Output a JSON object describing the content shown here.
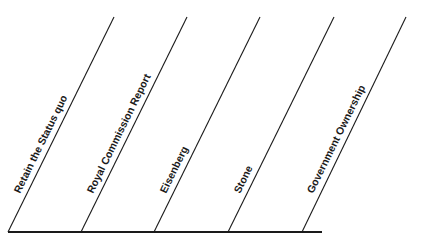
{
  "diagram": {
    "type": "continuum",
    "line_color": "#1a1a1a",
    "baseline": {
      "x1": 8,
      "y": 232,
      "x2": 322,
      "thickness": 2.2
    },
    "spokes": [
      {
        "label": "Retain the Status quo",
        "bottom_x": 8,
        "top_x": 114
      },
      {
        "label": "Royal Commission Report",
        "bottom_x": 81,
        "top_x": 187
      },
      {
        "label": "Eisenberg",
        "bottom_x": 154,
        "top_x": 260
      },
      {
        "label": "Stone",
        "bottom_x": 228,
        "top_x": 334
      },
      {
        "label": "Government Ownership",
        "bottom_x": 302,
        "top_x": 406
      }
    ],
    "spoke_top_y": 17,
    "spoke_bottom_y": 232
  }
}
